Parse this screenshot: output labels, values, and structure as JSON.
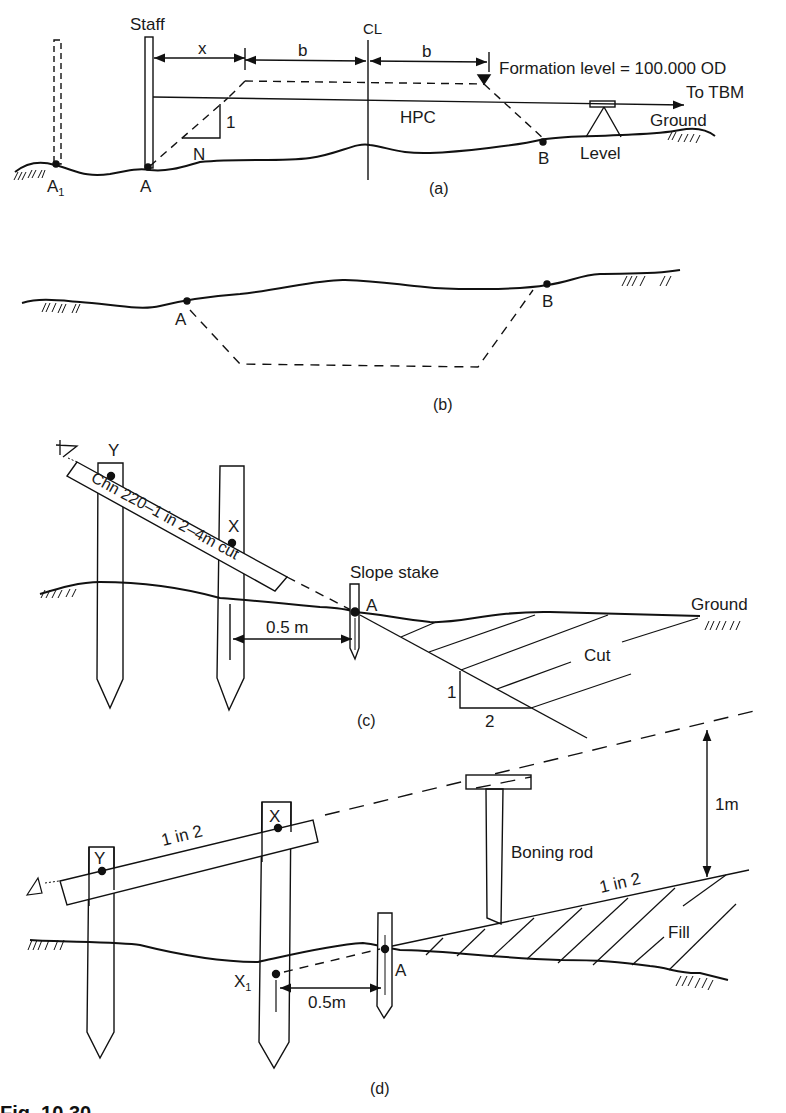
{
  "figure": {
    "caption": "Fig. 10.30",
    "panels": {
      "a": {
        "label": "(a)",
        "staff": "Staff",
        "x": "x",
        "b1": "b",
        "b2": "b",
        "centerline": "CL",
        "formation": "Formation level = 100.000 OD",
        "to_tbm": "To TBM",
        "ground": "Ground",
        "hpc": "HPC",
        "slope_1": "1",
        "slope_n": "N",
        "point_a1": "A",
        "point_a1_sub": "1",
        "point_a": "A",
        "point_b": "B",
        "level": "Level"
      },
      "b": {
        "label": "(b)",
        "point_a": "A",
        "point_b": "B"
      },
      "c": {
        "label": "(c)",
        "point_y": "Y",
        "point_x": "X",
        "board_text": "Chn 220–1 in 2–4m cut",
        "slope_stake": "Slope stake",
        "point_a": "A",
        "ground": "Ground",
        "offset": "0.5 m",
        "cut": "Cut",
        "slope_1": "1",
        "slope_2": "2"
      },
      "d": {
        "label": "(d)",
        "slope_top": "1 in 2",
        "point_x": "X",
        "point_y": "Y",
        "boning_rod": "Boning rod",
        "height": "1m",
        "slope_fill": "1 in 2",
        "fill": "Fill",
        "point_x1": "X",
        "point_x1_sub": "1",
        "point_a": "A",
        "offset": "0.5m"
      }
    }
  }
}
